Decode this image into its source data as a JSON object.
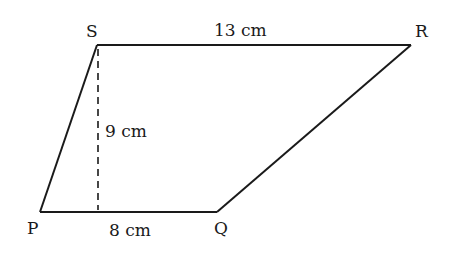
{
  "figure": {
    "type": "parallelogram-like quadrilateral",
    "vertices": {
      "P": {
        "label": "P",
        "x": 40,
        "y": 212
      },
      "Q": {
        "label": "Q",
        "x": 217,
        "y": 212
      },
      "R": {
        "label": "R",
        "x": 411,
        "y": 45
      },
      "S": {
        "label": "S",
        "x": 97,
        "y": 45
      }
    },
    "measurements": {
      "SR": "13 cm",
      "PQ": "8 cm",
      "height": "9 cm"
    },
    "colors": {
      "stroke": "#1a1a1a",
      "background": "#ffffff"
    }
  }
}
